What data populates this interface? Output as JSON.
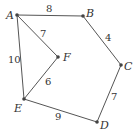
{
  "graph": {
    "nodes": [
      {
        "id": "A",
        "x": 17,
        "y": 15
      },
      {
        "id": "B",
        "x": 83,
        "y": 16
      },
      {
        "id": "C",
        "x": 121,
        "y": 65
      },
      {
        "id": "D",
        "x": 97,
        "y": 122
      },
      {
        "id": "E",
        "x": 24,
        "y": 99
      },
      {
        "id": "F",
        "x": 58,
        "y": 57
      }
    ],
    "edges": [
      {
        "from": "A",
        "to": "B",
        "weight": "8"
      },
      {
        "from": "B",
        "to": "C",
        "weight": "4"
      },
      {
        "from": "C",
        "to": "D",
        "weight": "7"
      },
      {
        "from": "D",
        "to": "E",
        "weight": "9"
      },
      {
        "from": "E",
        "to": "A",
        "weight": "10"
      },
      {
        "from": "A",
        "to": "F",
        "weight": "7"
      },
      {
        "from": "F",
        "to": "E",
        "weight": "6"
      }
    ]
  },
  "labels": {
    "A": "A",
    "B": "B",
    "C": "C",
    "D": "D",
    "E": "E",
    "F": "F",
    "w_ab": "8",
    "w_bc": "4",
    "w_cd": "7",
    "w_de": "9",
    "w_ea": "10",
    "w_af": "7",
    "w_fe": "6"
  }
}
